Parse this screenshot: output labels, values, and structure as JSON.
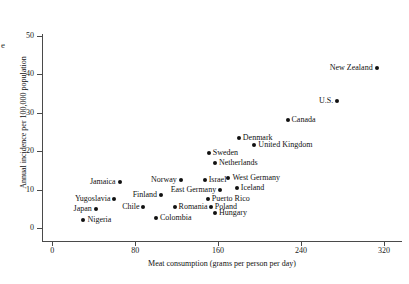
{
  "figure": {
    "corner_letter": "e"
  },
  "chart_data": {
    "type": "scatter",
    "title": "",
    "xlabel": "Meat consumption (grams per person per day)",
    "ylabel": "Annual incidence per 100,000 population",
    "xlim": [
      0,
      340
    ],
    "ylim": [
      0,
      53
    ],
    "xticks": [
      0,
      80,
      160,
      240,
      320
    ],
    "yticks": [
      0,
      10,
      20,
      30,
      40,
      50
    ],
    "grid": false,
    "legend": "none",
    "points": [
      {
        "label": "Nigeria",
        "x": 30,
        "y": 2,
        "side": "right"
      },
      {
        "label": "Japan",
        "x": 42,
        "y": 5,
        "side": "left"
      },
      {
        "label": "Yugoslavia",
        "x": 60,
        "y": 7.5,
        "side": "left"
      },
      {
        "label": "Jamaica",
        "x": 65,
        "y": 12,
        "side": "left"
      },
      {
        "label": "Chile",
        "x": 88,
        "y": 5.5,
        "side": "left"
      },
      {
        "label": "Colombia",
        "x": 100,
        "y": 2.5,
        "side": "right"
      },
      {
        "label": "Romania",
        "x": 118,
        "y": 5.5,
        "side": "right"
      },
      {
        "label": "Finland",
        "x": 105,
        "y": 8.5,
        "side": "left"
      },
      {
        "label": "Norway",
        "x": 124,
        "y": 12.5,
        "side": "left"
      },
      {
        "label": "Israel",
        "x": 147,
        "y": 12.5,
        "side": "right"
      },
      {
        "label": "Poland",
        "x": 153,
        "y": 5.5,
        "side": "right"
      },
      {
        "label": "Puerto Rico",
        "x": 150,
        "y": 7.5,
        "side": "right"
      },
      {
        "label": "Hungary",
        "x": 157,
        "y": 4,
        "side": "right"
      },
      {
        "label": "East Germany",
        "x": 162,
        "y": 10,
        "side": "left"
      },
      {
        "label": "Sweden",
        "x": 151,
        "y": 19.5,
        "side": "right"
      },
      {
        "label": "Netherlands",
        "x": 157,
        "y": 17,
        "side": "right"
      },
      {
        "label": "West Germany",
        "x": 170,
        "y": 13,
        "side": "right"
      },
      {
        "label": "Iceland",
        "x": 178,
        "y": 10.5,
        "side": "right"
      },
      {
        "label": "Denmark",
        "x": 180,
        "y": 23.5,
        "side": "right"
      },
      {
        "label": "United Kingdom",
        "x": 195,
        "y": 21.5,
        "side": "right"
      },
      {
        "label": "Canada",
        "x": 227,
        "y": 28,
        "side": "right"
      },
      {
        "label": "U.S.",
        "x": 275,
        "y": 33,
        "side": "left"
      },
      {
        "label": "New Zealand",
        "x": 313,
        "y": 41.5,
        "side": "left"
      }
    ]
  }
}
